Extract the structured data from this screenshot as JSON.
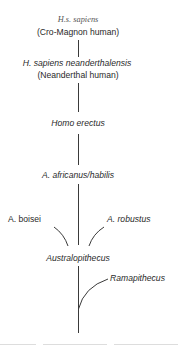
{
  "diagram": {
    "type": "phylogenetic-tree",
    "nodes": [
      {
        "id": "hs_sapiens",
        "label": "H.s. sapiens",
        "sublabel": "(Cro-Magnon human)"
      },
      {
        "id": "neanderthal",
        "label": "H. sapiens neanderthalensis",
        "sublabel": "(Neanderthal human)"
      },
      {
        "id": "erectus",
        "label": "Homo erectus"
      },
      {
        "id": "africanus",
        "label": "A. africanus/habilis"
      },
      {
        "id": "boisei",
        "label": "A. boisei"
      },
      {
        "id": "robustus",
        "label": "A. robustus"
      },
      {
        "id": "australopithecus",
        "label": "Australopithecus"
      },
      {
        "id": "ramapithecus",
        "label": "Ramapithecus"
      }
    ],
    "edges": [
      {
        "from": "neanderthal",
        "to": "hs_sapiens"
      },
      {
        "from": "erectus",
        "to": "neanderthal"
      },
      {
        "from": "africanus",
        "to": "erectus"
      },
      {
        "from": "australopithecus",
        "to": "africanus"
      },
      {
        "from": "australopithecus",
        "to": "boisei"
      },
      {
        "from": "australopithecus",
        "to": "robustus"
      },
      {
        "from": "root",
        "to": "australopithecus"
      },
      {
        "from": "root",
        "to": "ramapithecus"
      }
    ],
    "line_color": "#333333"
  }
}
